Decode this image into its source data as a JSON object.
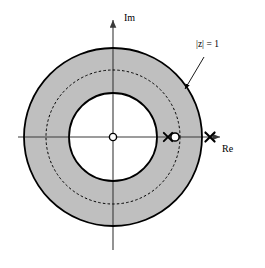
{
  "figure": {
    "name": "z-plane-region-of-convergence",
    "background_color": "#ffffff"
  },
  "axes": {
    "imaginary": {
      "label": "Im",
      "icon": "arrow-up-icon"
    },
    "real": {
      "label": "Re",
      "icon": "arrow-right-icon"
    },
    "origin": {
      "x": 113,
      "y": 137
    }
  },
  "annotations": [
    {
      "id": "unit-circle",
      "text": "|z| = 1",
      "points_to": "dashed-unit-circle",
      "leader_from": {
        "x": 204,
        "y": 57
      },
      "leader_to": {
        "x": 185,
        "y": 89
      }
    }
  ],
  "chart_data": {
    "type": "scatter",
    "title": "",
    "xlabel": "Re",
    "ylabel": "Im",
    "subtitle": "",
    "plane": "z-plane",
    "shaded_region": {
      "name": "region-of-convergence",
      "shape": "annulus",
      "inner_radius_units": 0.66,
      "outer_radius_units": 1.33,
      "fill_color": "#bfbfbf",
      "description": "Shaded annulus between inner and outer solid circles"
    },
    "circles": [
      {
        "name": "outer-boundary-circle",
        "radius_px": 89,
        "radius_units": 1.33,
        "style": "solid",
        "stroke": "#000000",
        "stroke_width": 1.8
      },
      {
        "name": "dashed-unit-circle",
        "radius_px": 67,
        "radius_units": 1.0,
        "style": "dashed",
        "stroke": "#000000",
        "stroke_width": 1.0,
        "label": "|z| = 1"
      },
      {
        "name": "inner-boundary-circle",
        "radius_px": 44,
        "radius_units": 0.66,
        "style": "solid",
        "stroke": "#000000",
        "stroke_width": 1.8
      }
    ],
    "markers": [
      {
        "name": "zero-at-origin",
        "symbol": "o",
        "kind": "zero",
        "x_units": 0.0,
        "y_units": 0.0,
        "x_px": 113,
        "y_px": 137
      },
      {
        "name": "pole-inner",
        "symbol": "x",
        "kind": "pole",
        "x_units": 0.82,
        "y_units": 0.0,
        "x_px": 168,
        "y_px": 137
      },
      {
        "name": "zero-inner",
        "symbol": "o",
        "kind": "zero",
        "x_units": 0.92,
        "y_units": 0.0,
        "x_px": 175,
        "y_px": 137
      },
      {
        "name": "pole-outer",
        "symbol": "x",
        "kind": "pole",
        "x_units": 1.45,
        "y_units": 0.0,
        "x_px": 210,
        "y_px": 137
      }
    ],
    "axis_extent": {
      "re_min_px": 18,
      "re_max_px": 222,
      "im_min_px": 250,
      "im_max_px": 18
    },
    "grid": false,
    "legend": null
  },
  "colors": {
    "shade": "#bfbfbf",
    "stroke": "#000000",
    "axis": "#3a3a3a",
    "background": "#ffffff"
  }
}
